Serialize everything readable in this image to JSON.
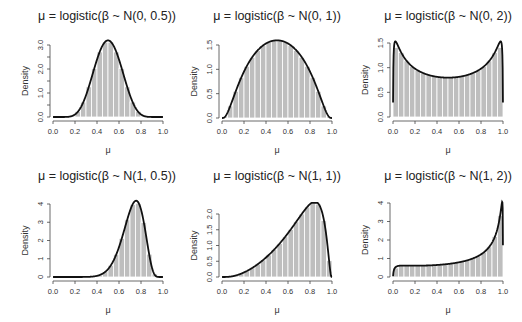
{
  "figure": {
    "width": 522,
    "height": 322,
    "colors": {
      "bar_fill": "#bebebe",
      "bar_border": "#ffffff",
      "curve": "#111111",
      "axis": "#444444"
    }
  },
  "chart_data": [
    {
      "type": "bar",
      "title": "μ = logistic(β ~ N(0, 0.5))",
      "xlabel": "μ",
      "ylabel": "Density",
      "prior": {
        "mean": 0,
        "sd": 0.5
      },
      "xlim": [
        0,
        1
      ],
      "ylim": [
        0,
        3.2
      ],
      "x_ticks": [
        "0.0",
        "0.2",
        "0.4",
        "0.6",
        "0.8",
        "1.0"
      ],
      "y_ticks": [
        {
          "v": 0,
          "l": "0.0"
        },
        {
          "v": 1,
          "l": "1.0"
        },
        {
          "v": 2,
          "l": "2.0"
        },
        {
          "v": 3,
          "l": "3.0"
        }
      ],
      "y_minor": [
        0.5,
        1.5,
        2.5
      ],
      "bins": 20,
      "overlay": "density curve (logit-normal)",
      "grid": false,
      "legend": "none",
      "box": {
        "x0": 53,
        "x1": 163,
        "y0": 117,
        "ytop": 45,
        "yval_top": 3.0,
        "axis_y": 121,
        "axis_x": 50
      },
      "title_pos": {
        "x": 107,
        "y": 20
      }
    },
    {
      "type": "bar",
      "title": "μ = logistic(β ~ N(0, 1))",
      "xlabel": "μ",
      "ylabel": "Density",
      "prior": {
        "mean": 0,
        "sd": 1
      },
      "xlim": [
        0,
        1
      ],
      "ylim": [
        0,
        1.6
      ],
      "x_ticks": [
        "0.0",
        "0.2",
        "0.4",
        "0.6",
        "0.8",
        "1.0"
      ],
      "y_ticks": [
        {
          "v": 0,
          "l": "0.0"
        },
        {
          "v": 0.5,
          "l": "0.5"
        },
        {
          "v": 1,
          "l": "1.0"
        },
        {
          "v": 1.5,
          "l": "1.5"
        }
      ],
      "y_minor": [],
      "bins": 20,
      "overlay": "density curve (logit-normal)",
      "grid": false,
      "legend": "none",
      "box": {
        "x0": 222,
        "x1": 332,
        "y0": 118,
        "ytop": 45,
        "yval_top": 1.5,
        "axis_y": 121,
        "axis_x": 219
      },
      "title_pos": {
        "x": 277,
        "y": 20
      }
    },
    {
      "type": "bar",
      "title": "μ = logistic(β ~ N(0, 2))",
      "xlabel": "μ",
      "ylabel": "Density",
      "prior": {
        "mean": 0,
        "sd": 2
      },
      "xlim": [
        0,
        1
      ],
      "ylim": [
        0,
        1.55
      ],
      "x_ticks": [
        "0.0",
        "0.2",
        "0.4",
        "0.6",
        "0.8",
        "1.0"
      ],
      "y_ticks": [
        {
          "v": 0,
          "l": "0.0"
        },
        {
          "v": 0.5,
          "l": "0.5"
        },
        {
          "v": 1,
          "l": "1.0"
        },
        {
          "v": 1.5,
          "l": "1.5"
        }
      ],
      "y_minor": [],
      "bins": 20,
      "overlay": "density curve (logit-normal)",
      "grid": false,
      "legend": "none",
      "box": {
        "x0": 393,
        "x1": 503,
        "y0": 117,
        "ytop": 43,
        "yval_top": 1.5,
        "axis_y": 121,
        "axis_x": 390
      },
      "title_pos": {
        "x": 448,
        "y": 20
      }
    },
    {
      "type": "bar",
      "title": "μ = logistic(β ~ N(1, 0.5))",
      "xlabel": "μ",
      "ylabel": "Density",
      "prior": {
        "mean": 1,
        "sd": 0.5
      },
      "xlim": [
        0,
        1
      ],
      "ylim": [
        0,
        4.2
      ],
      "x_ticks": [
        "0.0",
        "0.2",
        "0.4",
        "0.6",
        "0.8",
        "1.0"
      ],
      "y_ticks": [
        {
          "v": 0,
          "l": "0"
        },
        {
          "v": 1,
          "l": "1"
        },
        {
          "v": 2,
          "l": "2"
        },
        {
          "v": 3,
          "l": "3"
        },
        {
          "v": 4,
          "l": "4"
        }
      ],
      "y_minor": [],
      "bins": 20,
      "overlay": "density curve (logit-normal)",
      "grid": false,
      "legend": "none",
      "box": {
        "x0": 53,
        "x1": 163,
        "y0": 277,
        "ytop": 204,
        "yval_top": 4,
        "axis_y": 281,
        "axis_x": 50
      },
      "title_pos": {
        "x": 107,
        "y": 180
      }
    },
    {
      "type": "bar",
      "title": "μ = logistic(β ~ N(1, 1))",
      "xlabel": "μ",
      "ylabel": "Density",
      "prior": {
        "mean": 1,
        "sd": 1
      },
      "xlim": [
        0,
        1
      ],
      "ylim": [
        0,
        2.35
      ],
      "x_ticks": [
        "0.0",
        "0.2",
        "0.4",
        "0.6",
        "0.8",
        "1.0"
      ],
      "y_ticks": [
        {
          "v": 0,
          "l": "0.0"
        },
        {
          "v": 0.5,
          "l": "0.5"
        },
        {
          "v": 1,
          "l": "1.0"
        },
        {
          "v": 1.5,
          "l": "1.5"
        },
        {
          "v": 2,
          "l": "2.0"
        }
      ],
      "y_minor": [],
      "bins": 20,
      "overlay": "density curve (logit-normal)",
      "grid": false,
      "legend": "none",
      "box": {
        "x0": 222,
        "x1": 332,
        "y0": 277,
        "ytop": 214,
        "yval_top": 2.0,
        "axis_y": 281,
        "axis_x": 219
      },
      "title_pos": {
        "x": 277,
        "y": 180
      }
    },
    {
      "type": "bar",
      "title": "μ = logistic(β ~ N(1, 2))",
      "xlabel": "μ",
      "ylabel": "Density",
      "prior": {
        "mean": 1,
        "sd": 2
      },
      "xlim": [
        0,
        1
      ],
      "ylim": [
        0,
        4.1
      ],
      "x_ticks": [
        "0.0",
        "0.2",
        "0.4",
        "0.6",
        "0.8",
        "1.0"
      ],
      "y_ticks": [
        {
          "v": 0,
          "l": "0"
        },
        {
          "v": 1,
          "l": "1"
        },
        {
          "v": 2,
          "l": "2"
        },
        {
          "v": 3,
          "l": "3"
        },
        {
          "v": 4,
          "l": "4"
        }
      ],
      "y_minor": [],
      "bins": 20,
      "overlay": "density curve (logit-normal)",
      "grid": false,
      "legend": "none",
      "box": {
        "x0": 393,
        "x1": 503,
        "y0": 277,
        "ytop": 203,
        "yval_top": 4,
        "axis_y": 281,
        "axis_x": 390
      },
      "title_pos": {
        "x": 448,
        "y": 180
      }
    }
  ]
}
